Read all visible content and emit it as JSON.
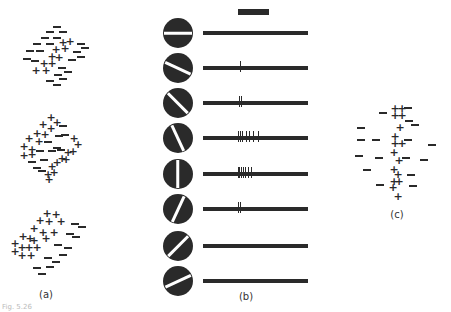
{
  "figure": {
    "caption": "Fig. 5.26",
    "panel_labels": {
      "a": "(a)",
      "b": "(b)",
      "c": "(c)"
    },
    "colors": {
      "ink": "#2a2a2a",
      "background": "#ffffff"
    }
  },
  "panel_a": {
    "description": "Receptive fields with excitatory (+) and inhibitory (-) regions at three orientations",
    "fields": [
      {
        "name": "field-top",
        "plus": [
          [
            63,
            42
          ],
          [
            70,
            41
          ],
          [
            56,
            49
          ],
          [
            65,
            48
          ],
          [
            52,
            56
          ],
          [
            59,
            57
          ],
          [
            44,
            63
          ],
          [
            52,
            63
          ],
          [
            36,
            70
          ],
          [
            46,
            70
          ]
        ],
        "minus": [
          [
            57,
            27
          ],
          [
            50,
            32
          ],
          [
            63,
            32
          ],
          [
            45,
            38
          ],
          [
            57,
            38
          ],
          [
            37,
            44
          ],
          [
            50,
            44
          ],
          [
            81,
            44
          ],
          [
            30,
            51
          ],
          [
            40,
            51
          ],
          [
            85,
            48
          ],
          [
            27,
            59
          ],
          [
            35,
            61
          ],
          [
            77,
            52
          ],
          [
            72,
            60
          ],
          [
            81,
            57
          ],
          [
            62,
            68
          ],
          [
            68,
            72
          ],
          [
            58,
            75
          ],
          [
            63,
            79
          ],
          [
            50,
            81
          ],
          [
            57,
            85
          ]
        ]
      },
      {
        "name": "field-middle",
        "plus": [
          [
            51,
            117
          ],
          [
            57,
            122
          ],
          [
            43,
            124
          ],
          [
            51,
            128
          ],
          [
            37,
            133
          ],
          [
            45,
            134
          ],
          [
            29,
            138
          ],
          [
            39,
            141
          ],
          [
            24,
            146
          ],
          [
            32,
            149
          ],
          [
            74,
            138
          ],
          [
            78,
            144
          ],
          [
            24,
            155
          ],
          [
            32,
            154
          ],
          [
            68,
            152
          ],
          [
            73,
            151
          ],
          [
            62,
            158
          ],
          [
            57,
            162
          ],
          [
            66,
            159
          ],
          [
            52,
            166
          ],
          [
            54,
            172
          ],
          [
            48,
            174
          ],
          [
            49,
            179
          ]
        ],
        "minus": [
          [
            63,
            126
          ],
          [
            59,
            136
          ],
          [
            65,
            135
          ],
          [
            48,
            142
          ],
          [
            57,
            148
          ],
          [
            61,
            150
          ],
          [
            40,
            151
          ],
          [
            52,
            151
          ],
          [
            32,
            162
          ],
          [
            44,
            160
          ],
          [
            37,
            168
          ],
          [
            42,
            171
          ]
        ]
      },
      {
        "name": "field-bottom",
        "plus": [
          [
            47,
            213
          ],
          [
            56,
            214
          ],
          [
            40,
            220
          ],
          [
            49,
            221
          ],
          [
            61,
            221
          ],
          [
            34,
            228
          ],
          [
            43,
            232
          ],
          [
            54,
            232
          ],
          [
            23,
            236
          ],
          [
            30,
            238
          ],
          [
            34,
            240
          ],
          [
            46,
            238
          ],
          [
            15,
            243
          ],
          [
            22,
            247
          ],
          [
            29,
            247
          ],
          [
            37,
            247
          ],
          [
            15,
            251
          ],
          [
            22,
            255
          ],
          [
            31,
            255
          ]
        ],
        "minus": [
          [
            75,
            224
          ],
          [
            82,
            227
          ],
          [
            70,
            234
          ],
          [
            76,
            237
          ],
          [
            58,
            245
          ],
          [
            68,
            248
          ],
          [
            63,
            255
          ],
          [
            48,
            258
          ],
          [
            56,
            262
          ],
          [
            37,
            268
          ],
          [
            50,
            267
          ],
          [
            42,
            274
          ]
        ]
      }
    ]
  },
  "panel_b": {
    "description": "Responses of a simple cell to a bar stimulus at different orientations",
    "stimulus_bar_label": "stimulus duration",
    "rows": [
      {
        "angle_deg": 0,
        "spikes": []
      },
      {
        "angle_deg": 25,
        "spikes": [
          240
        ]
      },
      {
        "angle_deg": 45,
        "spikes": [
          239,
          241
        ]
      },
      {
        "angle_deg": 65,
        "spikes": [
          238,
          240,
          242,
          246,
          249,
          253,
          258
        ]
      },
      {
        "angle_deg": 90,
        "spikes": [
          238,
          239,
          241,
          243,
          245,
          248,
          251
        ]
      },
      {
        "angle_deg": -65,
        "spikes": [
          238,
          240
        ]
      },
      {
        "angle_deg": -45,
        "spikes": []
      },
      {
        "angle_deg": -25,
        "spikes": []
      }
    ]
  },
  "panel_c": {
    "description": "Receptive field with central vertical excitatory strip",
    "plus": [
      [
        395,
        108
      ],
      [
        402,
        108
      ],
      [
        395,
        115
      ],
      [
        402,
        115
      ],
      [
        400,
        127
      ],
      [
        395,
        136
      ],
      [
        395,
        143
      ],
      [
        402,
        143
      ],
      [
        394,
        152
      ],
      [
        399,
        160
      ],
      [
        394,
        169
      ],
      [
        398,
        174
      ],
      [
        394,
        181
      ],
      [
        399,
        181
      ],
      [
        393,
        187
      ],
      [
        398,
        196
      ]
    ],
    "minus": [
      [
        383,
        113
      ],
      [
        408,
        108
      ],
      [
        409,
        121
      ],
      [
        415,
        125
      ],
      [
        361,
        128
      ],
      [
        361,
        140
      ],
      [
        376,
        140
      ],
      [
        408,
        140
      ],
      [
        432,
        145
      ],
      [
        359,
        156
      ],
      [
        379,
        158
      ],
      [
        406,
        158
      ],
      [
        424,
        160
      ],
      [
        367,
        170
      ],
      [
        411,
        175
      ],
      [
        380,
        185
      ],
      [
        413,
        186
      ]
    ]
  }
}
